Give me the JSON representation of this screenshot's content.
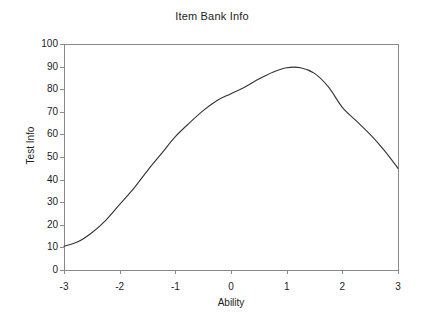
{
  "chart_data": {
    "type": "line",
    "title": "Item Bank Info",
    "xlabel": "Ability",
    "ylabel": "Test Info",
    "xlim": [
      -3,
      3
    ],
    "ylim": [
      0,
      100
    ],
    "xticks": [
      "-3",
      "-2",
      "-1",
      "0",
      "1",
      "2",
      "3"
    ],
    "xtick_values": [
      -3,
      -2,
      -1,
      0,
      1,
      2,
      3
    ],
    "yticks": [
      "0",
      "10",
      "20",
      "30",
      "40",
      "50",
      "60",
      "70",
      "80",
      "90",
      "100"
    ],
    "ytick_values": [
      0,
      10,
      20,
      30,
      40,
      50,
      60,
      70,
      80,
      90,
      100
    ],
    "grid": false,
    "legend": null,
    "series": [
      {
        "name": "Item Bank Info",
        "color": "#333333",
        "x": [
          -3,
          -2.75,
          -2.5,
          -2.25,
          -2,
          -1.75,
          -1.5,
          -1.25,
          -1,
          -0.75,
          -0.5,
          -0.25,
          0,
          0.25,
          0.5,
          0.75,
          1,
          1.25,
          1.5,
          1.75,
          2,
          2.25,
          2.5,
          2.75,
          3
        ],
        "values": [
          10.5,
          12.5,
          16.5,
          22,
          29,
          36,
          44,
          51.5,
          59,
          65,
          70.5,
          75,
          78,
          81,
          84.5,
          87.5,
          89.5,
          89.5,
          87,
          81,
          72,
          66,
          60,
          53,
          45
        ]
      }
    ]
  },
  "axes": {
    "frame_color": "#8a8a8a",
    "tick_color": "#8a8a8a"
  }
}
